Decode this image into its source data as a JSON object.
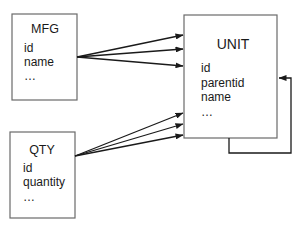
{
  "entities": {
    "mfg": {
      "title": "MFG",
      "fields": [
        "id",
        "name",
        "..."
      ]
    },
    "qty": {
      "title": "QTY",
      "fields": [
        "id",
        "quantity",
        "..."
      ]
    },
    "unit": {
      "title": "UNIT",
      "fields": [
        "id",
        "parentid",
        "name",
        "..."
      ]
    }
  },
  "relationships": [
    {
      "from": "MFG",
      "to": "UNIT",
      "count": 3
    },
    {
      "from": "QTY",
      "to": "UNIT",
      "count": 3
    },
    {
      "from": "UNIT",
      "to": "UNIT",
      "count": 1,
      "kind": "self-reference"
    }
  ],
  "colors": {
    "line": "#1a1a1a",
    "box_border": "#6a6a6a",
    "background": "#ffffff"
  }
}
